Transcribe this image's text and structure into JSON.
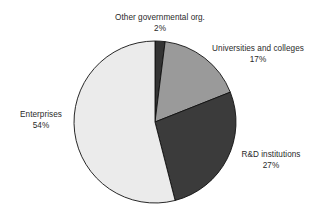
{
  "chart_data": {
    "type": "pie",
    "title": "",
    "subtitle": "",
    "xlabel": "",
    "ylabel": "",
    "legend_position": "none",
    "grid": false,
    "units": "percent",
    "categories": [
      "Other governmental org.",
      "Universities and colleges",
      "R&D institutions",
      "Enterprises"
    ],
    "values": [
      2,
      17,
      27,
      54
    ],
    "slices": [
      {
        "label": "Other governmental org.",
        "value": 2,
        "value_label": "2%",
        "color": "#333333",
        "start_angle_deg": 0,
        "end_angle_deg": 7.2
      },
      {
        "label": "Universities and colleges",
        "value": 17,
        "value_label": "17%",
        "color": "#9a9a9a",
        "start_angle_deg": 7.2,
        "end_angle_deg": 68.4
      },
      {
        "label": "R&D institutions",
        "value": 27,
        "value_label": "27%",
        "color": "#3b3b3b",
        "start_angle_deg": 68.4,
        "end_angle_deg": 165.6
      },
      {
        "label": "Enterprises",
        "value": 54,
        "value_label": "54%",
        "color": "#ebebeb",
        "start_angle_deg": 165.6,
        "end_angle_deg": 360
      }
    ]
  },
  "labels": {
    "other": {
      "name": "Other governmental org.",
      "pct": "2%"
    },
    "universities": {
      "name": "Universities and colleges",
      "pct": "17%"
    },
    "rnd": {
      "name": "R&D institutions",
      "pct": "27%"
    },
    "enterprises": {
      "name": "Enterprises",
      "pct": "54%"
    }
  },
  "style": {
    "background": "#ffffff",
    "outline": "#111111",
    "text_color": "#2a2a2a"
  }
}
